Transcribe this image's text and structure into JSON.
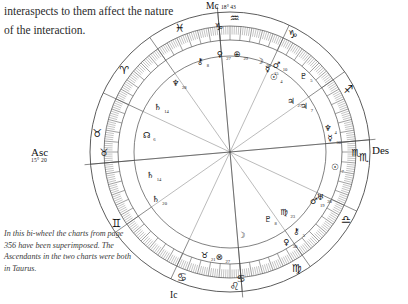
{
  "page": {
    "body_text": "interaspects to them affect the nature of the interaction.",
    "caption": "In this bi-wheel the charts from page 356 have been superimposed. The Ascendants in the two charts were both in Taurus."
  },
  "chart": {
    "type": "astrological-biwheel",
    "angles": [
      {
        "name": "Asc",
        "label": "Asc",
        "degree_label": "15° 20",
        "glyph": "♉",
        "glyph_name": "taurus",
        "position": "left"
      },
      {
        "name": "Des",
        "label": "Des",
        "degree_label": "",
        "glyph": "♏",
        "glyph_name": "scorpio",
        "position": "right"
      },
      {
        "name": "MC",
        "label": "Mc",
        "degree_label": "18° 43",
        "glyph": "♑",
        "glyph_name": "capricorn",
        "position": "top"
      },
      {
        "name": "IC",
        "label": "Ic",
        "degree_label": "",
        "glyph": "♋",
        "glyph_name": "cancer",
        "position": "bottom"
      }
    ],
    "zodiac_signs": [
      {
        "name": "pisces",
        "glyph": "♓",
        "angle_deg": 112
      },
      {
        "name": "aries",
        "glyph": "♈",
        "angle_deg": 142
      },
      {
        "name": "taurus",
        "glyph": "♉",
        "angle_deg": 172
      },
      {
        "name": "gemini",
        "glyph": "♊",
        "angle_deg": 212
      },
      {
        "name": "cancer",
        "glyph": "♋",
        "angle_deg": 249
      },
      {
        "name": "leo",
        "glyph": "♌",
        "angle_deg": 272
      },
      {
        "name": "virgo",
        "glyph": "♍",
        "angle_deg": 300
      },
      {
        "name": "libra",
        "glyph": "♎",
        "angle_deg": 330
      },
      {
        "name": "scorpio",
        "glyph": "♏",
        "angle_deg": 358
      },
      {
        "name": "sagittarius",
        "glyph": "♐",
        "angle_deg": 28
      },
      {
        "name": "capricorn",
        "glyph": "♑",
        "angle_deg": 62
      },
      {
        "name": "aquarius",
        "glyph": "♒",
        "angle_deg": 88
      }
    ],
    "planets": [
      {
        "name": "saturn",
        "glyph": "♄",
        "degree": "14",
        "angle_deg": 148,
        "radius": 0.6
      },
      {
        "name": "neptune",
        "glyph": "♆",
        "degree": "28",
        "angle_deg": 128,
        "radius": 0.63
      },
      {
        "name": "ascendant-node",
        "glyph": "☊",
        "degree": "6",
        "angle_deg": 168,
        "radius": 0.6
      },
      {
        "name": "chiron",
        "glyph": "⚷",
        "degree": "8",
        "angle_deg": 108,
        "radius": 0.7
      },
      {
        "name": "venus",
        "glyph": "♀",
        "degree": "27",
        "angle_deg": 96,
        "radius": 0.72
      },
      {
        "name": "earth",
        "glyph": "⊕",
        "degree": "29",
        "angle_deg": 86,
        "radius": 0.72
      },
      {
        "name": "moon-2",
        "glyph": "☽",
        "degree": "26",
        "angle_deg": 72,
        "radius": 0.7
      },
      {
        "name": "mercury",
        "glyph": "☿",
        "degree": "15",
        "angle_deg": 66,
        "radius": 0.66
      },
      {
        "name": "sun",
        "glyph": "☉",
        "degree": "4",
        "angle_deg": 60,
        "radius": 0.62
      },
      {
        "name": "mars",
        "glyph": "♂",
        "degree": "10",
        "angle_deg": 62,
        "radius": 0.72
      },
      {
        "name": "pluto",
        "glyph": "♇",
        "degree": "5",
        "angle_deg": 46,
        "radius": 0.8
      },
      {
        "name": "jupiter",
        "glyph": "♃",
        "degree": "27",
        "angle_deg": 40,
        "radius": 0.55
      },
      {
        "name": "jupiter-2",
        "glyph": "♃",
        "degree": "7",
        "angle_deg": 32,
        "radius": 0.62
      },
      {
        "name": "neptune-2",
        "glyph": "♆",
        "degree": "4",
        "angle_deg": 14,
        "radius": 0.74
      },
      {
        "name": "mercury-2",
        "glyph": "☿",
        "degree": "30",
        "angle_deg": 8,
        "radius": 0.74
      },
      {
        "name": "sun-2",
        "glyph": "☉",
        "degree": "7",
        "angle_deg": 352,
        "radius": 0.8
      },
      {
        "name": "uranus",
        "glyph": "♅",
        "degree": "20",
        "angle_deg": 334,
        "radius": 0.74
      },
      {
        "name": "mars-2",
        "glyph": "♂",
        "degree": "19",
        "angle_deg": 330,
        "radius": 0.7
      },
      {
        "name": "virgo-pt",
        "glyph": "♍",
        "degree": "23",
        "angle_deg": 312,
        "radius": 0.56
      },
      {
        "name": "pluto-2",
        "glyph": "♇",
        "degree": "8",
        "angle_deg": 300,
        "radius": 0.52
      },
      {
        "name": "chiron-2",
        "glyph": "⚷",
        "degree": "5",
        "angle_deg": 310,
        "radius": 0.76
      },
      {
        "name": "venus-2",
        "glyph": "♀",
        "degree": "30",
        "angle_deg": 302,
        "radius": 0.8
      },
      {
        "name": "saturn-2",
        "glyph": "♄",
        "degree": "20",
        "angle_deg": 212,
        "radius": 0.62
      },
      {
        "name": "saturn-3",
        "glyph": "♄",
        "degree": "14",
        "angle_deg": 196,
        "radius": 0.58
      },
      {
        "name": "taurus-pt",
        "glyph": "♉",
        "degree": "21",
        "angle_deg": 256,
        "radius": 0.78
      },
      {
        "name": "part-of-fortune",
        "glyph": "⊗",
        "degree": "27",
        "angle_deg": 264,
        "radius": 0.78
      },
      {
        "name": "moon",
        "glyph": "☽",
        "degree": "",
        "angle_deg": 278,
        "radius": 0.58
      }
    ],
    "rings": {
      "outer_radius": 140,
      "tick_ring_radius": 126,
      "inner_ring_radius": 112,
      "aspect_radius": 96
    },
    "house_count": 12
  }
}
